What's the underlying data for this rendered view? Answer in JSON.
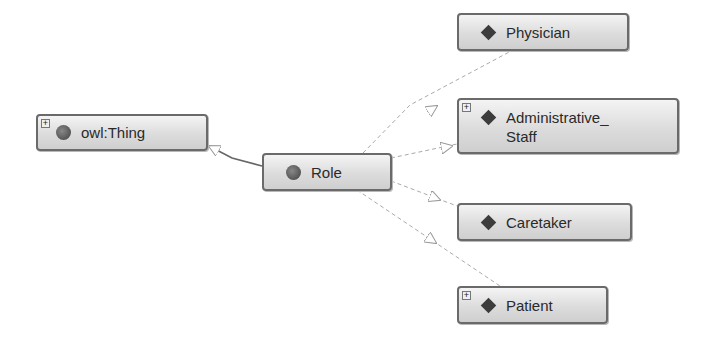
{
  "diagram": {
    "type": "ontology-class-graph",
    "nodes": [
      {
        "id": "owl_thing",
        "label": "owl:Thing",
        "icon": "circle-class-icon",
        "expandable": true
      },
      {
        "id": "role",
        "label": "Role",
        "icon": "circle-class-icon",
        "expandable": false
      },
      {
        "id": "physician",
        "label": "Physician",
        "icon": "diamond-individual-icon",
        "expandable": false
      },
      {
        "id": "admin_staff",
        "label": "Administrative_\nStaff",
        "label_line1": "Administrative_",
        "label_line2": "Staff",
        "icon": "diamond-individual-icon",
        "expandable": true
      },
      {
        "id": "caretaker",
        "label": "Caretaker",
        "icon": "diamond-individual-icon",
        "expandable": false
      },
      {
        "id": "patient",
        "label": "Patient",
        "icon": "diamond-individual-icon",
        "expandable": true
      }
    ],
    "edges": [
      {
        "from": "role",
        "to": "owl_thing",
        "style": "solid",
        "arrow": "hollow-triangle"
      },
      {
        "from": "physician",
        "to": "role",
        "style": "dashed",
        "arrow": "hollow-triangle"
      },
      {
        "from": "admin_staff",
        "to": "role",
        "style": "dashed",
        "arrow": "hollow-triangle"
      },
      {
        "from": "caretaker",
        "to": "role",
        "style": "dashed",
        "arrow": "hollow-triangle"
      },
      {
        "from": "patient",
        "to": "role",
        "style": "dashed",
        "arrow": "hollow-triangle"
      }
    ],
    "expand_symbol": "+"
  }
}
